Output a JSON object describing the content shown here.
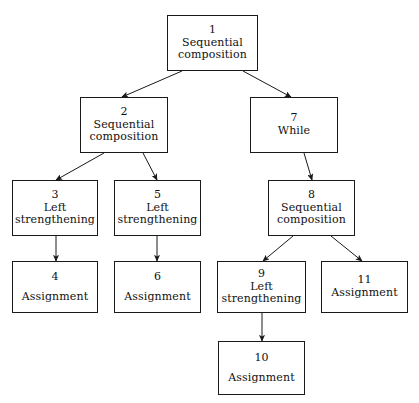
{
  "diagram": {
    "type": "tree",
    "background_color": "#ffffff",
    "line_color": "#1a1a1a",
    "text_color": "#111111",
    "nodes": [
      {
        "id": "node-1",
        "num": "1",
        "label": "Sequential\ncomposition",
        "x": 167,
        "y": 15,
        "w": 91,
        "h": 56,
        "gap": false
      },
      {
        "id": "node-2",
        "num": "2",
        "label": "Sequential\ncomposition",
        "x": 80,
        "y": 97,
        "w": 88,
        "h": 56,
        "gap": false
      },
      {
        "id": "node-7",
        "num": "7",
        "label": "While",
        "x": 250,
        "y": 97,
        "w": 88,
        "h": 56,
        "gap": false
      },
      {
        "id": "node-3",
        "num": "3",
        "label": "Left\nstrengthening",
        "x": 12,
        "y": 180,
        "w": 86,
        "h": 56,
        "gap": false
      },
      {
        "id": "node-5",
        "num": "5",
        "label": "Left\nstrengthening",
        "x": 114,
        "y": 180,
        "w": 87,
        "h": 56,
        "gap": false
      },
      {
        "id": "node-8",
        "num": "8",
        "label": "Sequential\ncomposition",
        "x": 268,
        "y": 180,
        "w": 87,
        "h": 56,
        "gap": false
      },
      {
        "id": "node-4",
        "num": "4",
        "label": "Assignment",
        "x": 12,
        "y": 261,
        "w": 86,
        "h": 52,
        "gap": true
      },
      {
        "id": "node-6",
        "num": "6",
        "label": "Assignment",
        "x": 114,
        "y": 261,
        "w": 87,
        "h": 52,
        "gap": true
      },
      {
        "id": "node-9",
        "num": "9",
        "label": "Left\nstrengthening",
        "x": 217,
        "y": 261,
        "w": 89,
        "h": 52,
        "gap": false
      },
      {
        "id": "node-11",
        "num": "11",
        "label": "Assignment",
        "x": 321,
        "y": 261,
        "w": 87,
        "h": 52,
        "gap": false
      },
      {
        "id": "node-10",
        "num": "10",
        "label": "Assignment",
        "x": 218,
        "y": 341,
        "w": 87,
        "h": 54,
        "gap": true
      }
    ],
    "edges": [
      {
        "id": "edge-1-2",
        "from": "node-1",
        "to": "node-2",
        "x1": 182,
        "y1": 71,
        "x2": 122,
        "y2": 97
      },
      {
        "id": "edge-1-7",
        "from": "node-1",
        "to": "node-7",
        "x1": 243,
        "y1": 71,
        "x2": 291,
        "y2": 97
      },
      {
        "id": "edge-2-3",
        "from": "node-2",
        "to": "node-3",
        "x1": 104,
        "y1": 153,
        "x2": 56,
        "y2": 180
      },
      {
        "id": "edge-2-5",
        "from": "node-2",
        "to": "node-5",
        "x1": 143,
        "y1": 153,
        "x2": 157,
        "y2": 180
      },
      {
        "id": "edge-7-8",
        "from": "node-7",
        "to": "node-8",
        "x1": 304,
        "y1": 153,
        "x2": 312,
        "y2": 180
      },
      {
        "id": "edge-3-4",
        "from": "node-3",
        "to": "node-4",
        "x1": 56,
        "y1": 236,
        "x2": 56,
        "y2": 261
      },
      {
        "id": "edge-5-6",
        "from": "node-5",
        "to": "node-6",
        "x1": 157,
        "y1": 236,
        "x2": 157,
        "y2": 261
      },
      {
        "id": "edge-8-9",
        "from": "node-8",
        "to": "node-9",
        "x1": 293,
        "y1": 236,
        "x2": 263,
        "y2": 261
      },
      {
        "id": "edge-8-11",
        "from": "node-8",
        "to": "node-11",
        "x1": 331,
        "y1": 236,
        "x2": 362,
        "y2": 261
      },
      {
        "id": "edge-9-10",
        "from": "node-9",
        "to": "node-10",
        "x1": 262,
        "y1": 313,
        "x2": 262,
        "y2": 341
      }
    ]
  }
}
